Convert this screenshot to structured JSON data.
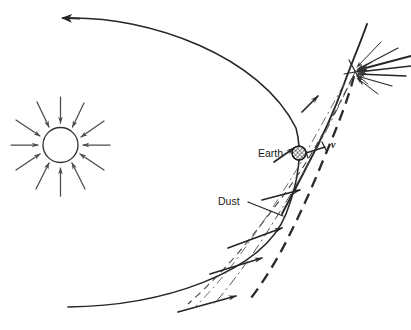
{
  "figure": {
    "kind": "scientific-line-diagram",
    "background_color": "#ffffff",
    "line_color": "#262626",
    "stroke_color_light": "#555555"
  },
  "labels": {
    "earth": "Earth",
    "dust": "Dust",
    "velocity": "v"
  },
  "objects": {
    "sun": {
      "name": "sun-circle",
      "center_x": 60.5,
      "center_y": 145.0,
      "radius": 17.5,
      "stroke": "#333333",
      "fill": "#ffffff",
      "ray_count": 12,
      "ray_direction": "inward",
      "ray_inner_radius": 22,
      "ray_outer_radius": 48
    },
    "earth": {
      "name": "earth-marker",
      "center_x": 299.0,
      "center_y": 153.0,
      "radius": 7.0,
      "fill_pattern": "cross-hatch",
      "stroke": "#1a1a1a"
    },
    "convergence_point": {
      "name": "dust-source-convergence",
      "x": 355.0,
      "y": 72.0,
      "incoming_ray_count": 9
    }
  },
  "curves": {
    "main_trajectory": {
      "name": "earth-orbit-solid",
      "style": "solid",
      "stroke_width": 1.6,
      "arrow_head_at": "start-left",
      "start": [
        62,
        18
      ],
      "end": [
        67,
        307
      ]
    },
    "dust_stream_thin_dashed": {
      "name": "dust-stream-thin-dashed",
      "style": "dashed",
      "stroke_width": 1.1,
      "dash_pattern": "7 5"
    },
    "dust_stream_thick_dashed": {
      "name": "dust-stream-thick-dashed",
      "style": "dashed",
      "stroke_width": 2.3,
      "dash_pattern": "11 7"
    },
    "dust_axis_dashdot": {
      "name": "dust-axis-dash-dot",
      "style": "dash-dot",
      "stroke_width": 1.0,
      "dash_pattern": "10 4 2 4"
    },
    "flow_arrow_count": 6
  },
  "leader_lines": {
    "dust_leader": {
      "name": "dust-leader-line",
      "from": [
        248,
        202
      ],
      "to": [
        282,
        215
      ]
    },
    "velocity_leader": {
      "name": "velocity-tick",
      "from": [
        306,
        152
      ],
      "to": [
        328,
        146
      ]
    }
  }
}
